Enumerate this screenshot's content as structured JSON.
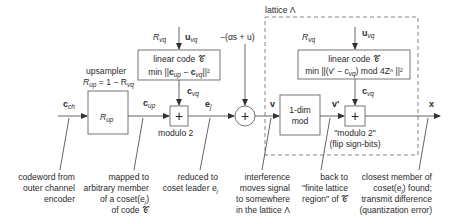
{
  "diagram": {
    "title_region": "lattice Λ",
    "blocks": {
      "upsampler": {
        "caption_line1": "upsampler",
        "caption_line2_main": "R",
        "caption_line2_sub": "up",
        "caption_line2_rest": " = 1 − R",
        "caption_line2_sub2": "vq",
        "box_main": "R",
        "box_sub": "up"
      },
      "linear_code_1": {
        "line1": "linear code 𝒞",
        "line2_pre": "min ||",
        "line2_c1": "c",
        "line2_s1": "up",
        "line2_mid": " − ",
        "line2_c2": "c",
        "line2_s2": "vq",
        "line2_post": "||²",
        "rate_main": "R",
        "rate_sub": "vq",
        "input_main": "u",
        "input_sub": "vq"
      },
      "modulo2": {
        "label": "modulo 2",
        "symbol": "+"
      },
      "adder": {
        "symbol": "+",
        "input_label": "−(αs + u)"
      },
      "one_dim_mod": {
        "line1": "1-dim",
        "line2": "mod"
      },
      "linear_code_2": {
        "line1": "linear code 𝒞",
        "line2": "min ||(v' − c",
        "line2_sub": "vq",
        "line2_rest": ") mod 4Zⁿ ||²",
        "rate_main": "R",
        "rate_sub": "vq",
        "input_main": "u",
        "input_sub": "vq"
      },
      "modulo2_flip": {
        "line1": "\"modulo 2\"",
        "line2": "(flip sign-bits)",
        "symbol": "+"
      }
    },
    "signals": {
      "c_ch": {
        "main": "c",
        "sub": "ch"
      },
      "c_up": {
        "main": "c",
        "sub": "up"
      },
      "c_vq_1": {
        "main": "c",
        "sub": "vq"
      },
      "e_j": {
        "main": "e",
        "sub": "j"
      },
      "v": {
        "main": "v"
      },
      "v_prime": {
        "main": "v'"
      },
      "c_vq_2": {
        "main": "c",
        "sub": "vq"
      },
      "x": {
        "main": "x"
      }
    },
    "annotations": [
      {
        "lines": [
          "codeword from",
          "outer channel",
          "encoder"
        ]
      },
      {
        "lines": [
          "mapped to",
          "arbitrary member",
          "of a coset(e",
          "of code 𝒞"
        ]
      },
      {
        "lines": [
          "reduced to",
          "coset leader e"
        ]
      },
      {
        "lines": [
          "interference",
          "moves signal",
          "to somewhere",
          "in the lattice Λ"
        ]
      },
      {
        "lines": [
          "back to",
          "\"finite lattice",
          "region\" of 𝒞"
        ]
      },
      {
        "lines": [
          "closest member of",
          "coset(e",
          "transmit difference",
          "(quantization error)"
        ]
      }
    ],
    "annotation_extras": {
      "a2_line3_sub": "j",
      "a2_line3_end": ")",
      "a3_line2_sub": "j",
      "a6_line2_sub": "j",
      "a6_line2_end": ") found;"
    }
  }
}
